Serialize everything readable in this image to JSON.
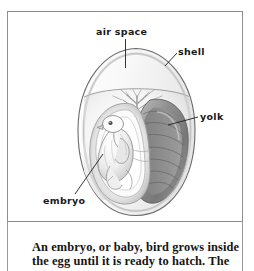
{
  "figure": {
    "labels": [
      {
        "id": "air-space",
        "text": "air space"
      },
      {
        "id": "shell",
        "text": "shell"
      },
      {
        "id": "yolk",
        "text": "yolk"
      },
      {
        "id": "embryo",
        "text": "embryo"
      }
    ],
    "parts": {
      "air_space": "air space",
      "shell": "shell",
      "yolk": "yolk",
      "embryo": "embryo"
    }
  },
  "caption": {
    "line1": "An embryo, or baby, bird grows inside",
    "line2": "the egg until it is ready to hatch. The"
  },
  "colors": {
    "frame_border": "#8e8e8e",
    "label_text": "#1a1a1a",
    "caption_text": "#141414",
    "leader_line": "#1f1f1f",
    "shell_outline": "#6b6b6b",
    "background": "#ffffff",
    "yolk_mid": "#9a9a9a",
    "yolk_dark": "#6e6e6e",
    "membrane": "#c9c9c9",
    "embryo_light": "#f2f2f2"
  }
}
